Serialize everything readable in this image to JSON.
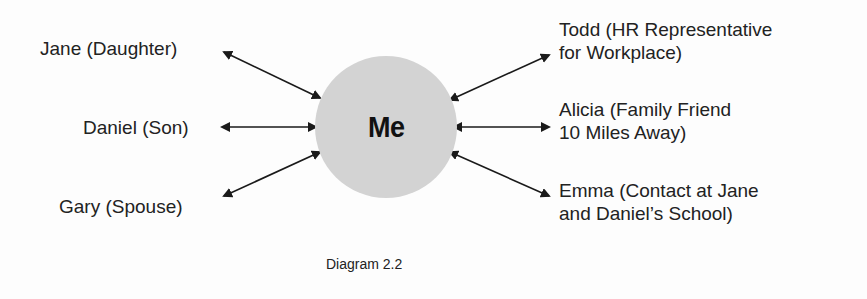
{
  "diagram": {
    "center": {
      "label": "Me",
      "fill": "#d3d3d3"
    },
    "left_nodes": [
      {
        "label": "Jane (Daughter)"
      },
      {
        "label": "Daniel (Son)"
      },
      {
        "label": "Gary (Spouse)"
      }
    ],
    "right_nodes": [
      {
        "line1": "Todd (HR Representative",
        "line2": "for Workplace)"
      },
      {
        "line1": "Alicia (Family Friend",
        "line2": "10 Miles Away)"
      },
      {
        "line1": "Emma (Contact at Jane",
        "line2": "and Daniel’s School)"
      }
    ],
    "connectors": "bidirectional-arrows",
    "caption": "Diagram 2.2"
  }
}
